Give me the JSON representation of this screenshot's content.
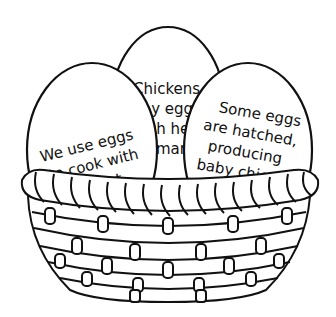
{
  "image": {
    "description": "Line-art worksheet: three eggs in a woven basket, each egg holding a fact about eggs",
    "background": "#ffffff",
    "stroke_color": "#111111"
  },
  "eggs": [
    {
      "position": "left",
      "lines": [
        "We use eggs",
        "to cook with",
        "and eat."
      ],
      "visible_lines": [
        "We use eggs",
        "to cook with",
        "nd eat."
      ]
    },
    {
      "position": "center",
      "lines": [
        "Chickens",
        "lay eggs",
        "which hatch",
        "many"
      ],
      "visible_lines": [
        "Chickens",
        "ay eggs",
        "ch he",
        "mar"
      ]
    },
    {
      "position": "right",
      "lines": [
        "Some eggs",
        "are hatched,",
        "producing",
        "baby chicks."
      ],
      "visible_lines": [
        "Some eggs",
        "are hatched,",
        "producing",
        "baby chic"
      ]
    }
  ],
  "basket": {
    "rim": "twisted rope",
    "rows": 5
  }
}
